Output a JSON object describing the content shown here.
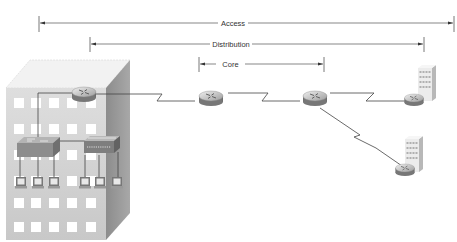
{
  "diagram": {
    "spans": [
      {
        "id": "access",
        "label": "Access",
        "x1": 39,
        "x2": 454,
        "y": 23
      },
      {
        "id": "distribution",
        "label": "Distribution",
        "x1": 90,
        "x2": 424,
        "y": 44
      },
      {
        "id": "core",
        "label": "Core",
        "x1": 199,
        "x2": 324,
        "y": 64
      }
    ],
    "nodes": [
      {
        "id": "campus-building",
        "type": "building",
        "label": ""
      },
      {
        "id": "building-router",
        "type": "router",
        "label": ""
      },
      {
        "id": "switch-1",
        "type": "switch",
        "label": ""
      },
      {
        "id": "switch-2",
        "type": "switch",
        "label": ""
      },
      {
        "id": "core-router-1",
        "type": "router",
        "label": ""
      },
      {
        "id": "core-router-2",
        "type": "router",
        "label": ""
      },
      {
        "id": "remote-site-1",
        "type": "building-with-router",
        "label": ""
      },
      {
        "id": "remote-site-2",
        "type": "building-with-router",
        "label": ""
      },
      {
        "id": "workstations",
        "type": "pc",
        "count": 6
      }
    ],
    "links": [
      {
        "from": "building-router",
        "to": "core-router-1",
        "type": "serial-wan"
      },
      {
        "from": "core-router-1",
        "to": "core-router-2",
        "type": "serial-wan"
      },
      {
        "from": "core-router-2",
        "to": "remote-site-1",
        "type": "serial-wan"
      },
      {
        "from": "core-router-2",
        "to": "remote-site-2",
        "type": "serial-wan"
      },
      {
        "from": "building-router",
        "to": "switch-1",
        "type": "ethernet"
      },
      {
        "from": "switch-1",
        "to": "switch-2",
        "type": "ethernet"
      }
    ],
    "colors": {
      "line": "#444444",
      "building_front": "#d2d2d2",
      "building_side": "#9a9a9a",
      "window": "#ffffff",
      "router": "#8a8a8a"
    }
  }
}
